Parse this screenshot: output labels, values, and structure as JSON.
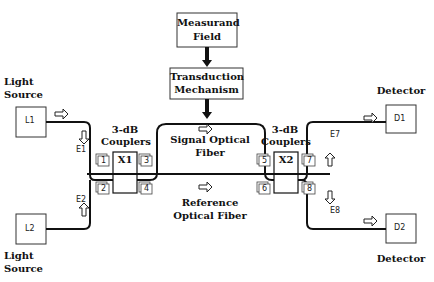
{
  "diagram": {
    "measurand_box": {
      "line1": "Measurand",
      "line2": "Field"
    },
    "transduction_box": {
      "line1": "Transduction",
      "line2": "Mechanism"
    },
    "light_source_top": {
      "label_line1": "Light",
      "label_line2": "Source",
      "box": "L1"
    },
    "light_source_bottom": {
      "label_line1": "Light",
      "label_line2": "Source",
      "box": "L2"
    },
    "detector_top": {
      "label": "Detector",
      "box": "D1"
    },
    "detector_bottom": {
      "label": "Detector",
      "box": "D2"
    },
    "coupler_left": {
      "label_line1": "3-dB",
      "label_line2": "Couplers",
      "symbol": "X1",
      "ports": [
        "1",
        "2",
        "3",
        "4"
      ]
    },
    "coupler_right": {
      "label_line1": "3-dB",
      "label_line2": "Couplers",
      "symbol": "X2",
      "ports": [
        "5",
        "6",
        "7",
        "8"
      ]
    },
    "signal_fiber": {
      "line1": "Signal Optical",
      "line2": "Fiber"
    },
    "reference_fiber": {
      "line1": "Reference",
      "line2": "Optical Fiber"
    },
    "fields": {
      "e1": "E1",
      "e2": "E2",
      "e7": "E7",
      "e8": "E8"
    },
    "colors": {
      "line": "#111111",
      "background": "#ffffff"
    }
  }
}
